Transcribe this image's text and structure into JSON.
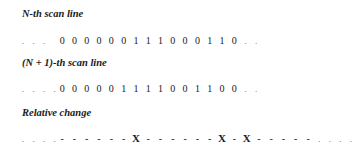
{
  "labels": {
    "line_n": "N-th scan line",
    "line_n1": "(N + 1)-th scan line",
    "relative": "Relative change"
  },
  "rows": {
    "line_n": {
      "lead": ". . .",
      "cells": [
        "0",
        "0",
        "0",
        "0",
        "0",
        "0",
        "1",
        "1",
        "1",
        "0",
        "0",
        "0",
        "1",
        "1",
        "0"
      ],
      "trail": ". ."
    },
    "line_n1": {
      "lead": ". . . .",
      "cells": [
        "0",
        "0",
        "0",
        "0",
        "0",
        "1",
        "1",
        "1",
        "1",
        "0",
        "0",
        "1",
        "1",
        "0",
        "0"
      ],
      "trail": ". ."
    },
    "relative": {
      "lead": ". . . .",
      "cells": [
        "-",
        "-",
        "-",
        "-",
        "-",
        "-",
        "X",
        "-",
        "-",
        "-",
        "-",
        "-",
        "-",
        "X",
        "-",
        "X",
        "-",
        "-",
        "-",
        "-",
        "-"
      ],
      "trail": ". . . ."
    }
  }
}
